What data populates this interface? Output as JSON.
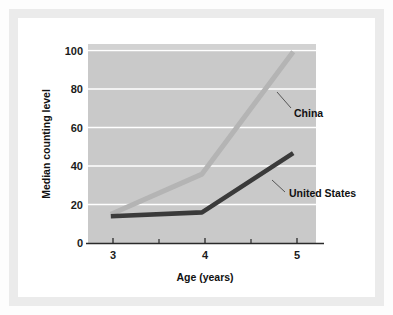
{
  "chart_data": {
    "type": "line",
    "title": "",
    "xlabel": "Age (years)",
    "ylabel": "Median counting level",
    "x": [
      3,
      4,
      5
    ],
    "xlim": [
      2.75,
      5.25
    ],
    "ylim": [
      0,
      104
    ],
    "xticks": [
      "3",
      "4",
      "5"
    ],
    "yticks": [
      "0",
      "20",
      "40",
      "60",
      "80",
      "100"
    ],
    "minor_xticks": [
      3.5,
      4.5
    ],
    "grid": "horizontal-white-gridlines",
    "legend": "inline-labels-with-leader-lines",
    "plot_background": "#c9c9c9",
    "series": [
      {
        "name": "China",
        "values": [
          15,
          36,
          100
        ],
        "color": "#b4b4b4",
        "label": "China",
        "label_x": 5.02,
        "label_y": 63
      },
      {
        "name": "United States",
        "values": [
          14,
          16,
          47
        ],
        "color": "#3a3a3a",
        "label": "United States",
        "label_x": 4.88,
        "label_y": 28
      }
    ]
  },
  "axes": {
    "y_axis_title": "Median counting level",
    "x_axis_title": "Age (years)",
    "y_tick_labels": [
      "100",
      "80",
      "60",
      "40",
      "20",
      "0"
    ],
    "x_tick_labels": [
      "3",
      "4",
      "5"
    ]
  },
  "labels": {
    "china": "China",
    "united_states": "United States"
  }
}
